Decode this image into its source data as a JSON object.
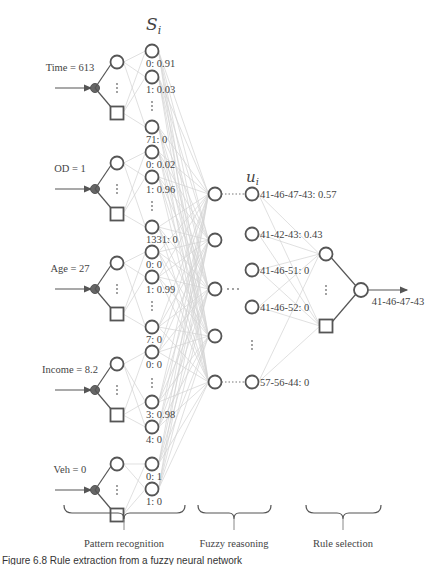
{
  "diagram": {
    "headers": {
      "s_label": "S",
      "s_sub": "i",
      "u_label": "u",
      "u_sub": "i"
    },
    "inputs": [
      {
        "label": "Time = 613",
        "y": 88,
        "s_nodes": [
          {
            "label": "0: 0.91",
            "y": 51
          },
          {
            "label": "1: 0.03",
            "y": 77
          },
          {
            "label": "71: 0",
            "y": 127
          }
        ]
      },
      {
        "label": "OD = 1",
        "y": 189,
        "s_nodes": [
          {
            "label": "0: 0.02",
            "y": 152
          },
          {
            "label": "1: 0.96",
            "y": 177
          },
          {
            "label": "1331: 0",
            "y": 227
          }
        ]
      },
      {
        "label": "Age = 27",
        "y": 289,
        "s_nodes": [
          {
            "label": "0: 0",
            "y": 252
          },
          {
            "label": "1: 0.99",
            "y": 277
          },
          {
            "label": "7: 0",
            "y": 327
          }
        ]
      },
      {
        "label": "Income = 8.2",
        "y": 390,
        "s_nodes": [
          {
            "label": "0: 0",
            "y": 352
          },
          {
            "label": "3: 0.98",
            "y": 402
          },
          {
            "label": "4: 0",
            "y": 427
          }
        ]
      },
      {
        "label": "Veh = 0",
        "y": 490,
        "s_nodes": [
          {
            "label": "0: 1",
            "y": 464
          },
          {
            "label": "1: 0",
            "y": 489
          }
        ]
      }
    ],
    "fuzzy_nodes_y": [
      194,
      240,
      289,
      336,
      382
    ],
    "u_nodes": [
      {
        "label": "41-46-47-43: 0.57",
        "y": 194
      },
      {
        "label": "41-42-43: 0.43",
        "y": 234
      },
      {
        "label": "41-46-51: 0",
        "y": 270
      },
      {
        "label": "41-46-52: 0",
        "y": 307
      },
      {
        "label": "57-56-44: 0",
        "y": 382
      }
    ],
    "ellipsis": "⋯",
    "output_label": "41-46-47-43",
    "sections": [
      {
        "label": "Pattern recognition"
      },
      {
        "label": "Fuzzy reasoning"
      },
      {
        "label": "Rule selection"
      }
    ],
    "caption": "Figure 6.8   Rule extraction from a fuzzy neural network"
  }
}
